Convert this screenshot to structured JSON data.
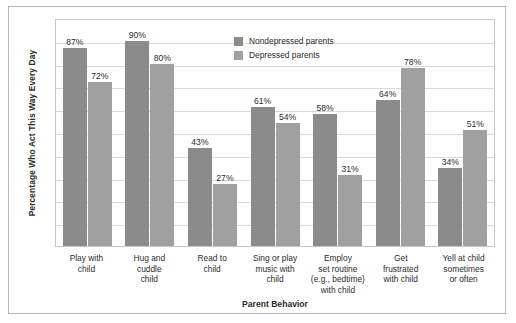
{
  "chart_data": {
    "type": "bar",
    "title": "",
    "xlabel": "Parent Behavior",
    "ylabel": "Percentage Who Act This Way Every Day",
    "ylim": [
      0,
      100
    ],
    "grid": true,
    "grid_divisions": 10,
    "axis_tick_labels": [],
    "legend_position": "top-center-right",
    "categories": [
      "Play with child",
      "Hug and cuddle child",
      "Read to child",
      "Sing or play music with child",
      "Employ set routine (e.g., bedtime) with child",
      "Get frustrated with child",
      "Yell at child sometimes or often"
    ],
    "category_lines": [
      [
        "Play with",
        "child"
      ],
      [
        "Hug and",
        "cuddle",
        "child"
      ],
      [
        "Read to",
        "child"
      ],
      [
        "Sing or play",
        "music with",
        "child"
      ],
      [
        "Employ",
        "set routine",
        "(e.g., bedtime)",
        "with child"
      ],
      [
        "Get",
        "frustrated",
        "with child"
      ],
      [
        "Yell at child",
        "sometimes",
        "or often"
      ]
    ],
    "series": [
      {
        "name": "Nondepressed parents",
        "color": "#8b8b8b",
        "values": [
          87,
          90,
          43,
          61,
          58,
          64,
          34
        ],
        "value_labels": [
          "87%",
          "90%",
          "43%",
          "61%",
          "58%",
          "64%",
          "34%"
        ]
      },
      {
        "name": "Depressed parents",
        "color": "#a0a0a0",
        "values": [
          72,
          80,
          27,
          54,
          31,
          78,
          51
        ],
        "value_labels": [
          "72%",
          "80%",
          "27%",
          "54%",
          "31%",
          "78%",
          "51%"
        ]
      }
    ]
  },
  "legend": {
    "items": [
      {
        "label": "Nondepressed parents",
        "color": "#8b8b8b"
      },
      {
        "label": "Depressed parents",
        "color": "#a0a0a0"
      }
    ]
  },
  "colors": {
    "nondepressed": "#8b8b8b",
    "depressed": "#a0a0a0",
    "gridline": "#d9d9d9",
    "frame": "#b9b9b9",
    "text": "#2b2b2b"
  }
}
